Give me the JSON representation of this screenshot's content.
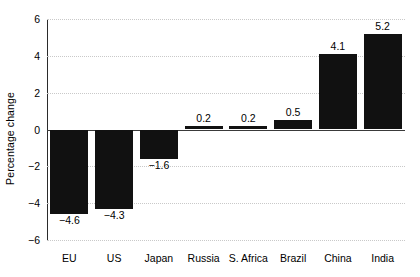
{
  "chart_data": {
    "type": "bar",
    "title": "",
    "xlabel": "",
    "ylabel": "Percentage change",
    "categories": [
      "EU",
      "US",
      "Japan",
      "Russia",
      "S. Africa",
      "Brazil",
      "China",
      "India"
    ],
    "values": [
      -4.6,
      -4.3,
      -1.6,
      0.2,
      0.2,
      0.5,
      4.1,
      5.2
    ],
    "value_labels": [
      "−4.6",
      "−4.3",
      "−1.6",
      "0.2",
      "0.2",
      "0.5",
      "4.1",
      "5.2"
    ],
    "ylim": [
      -6,
      6
    ],
    "yticks": [
      6,
      4,
      2,
      0,
      -2,
      -4,
      -6
    ],
    "ytick_labels": [
      "6",
      "4",
      "2",
      "0",
      "−2",
      "−4",
      "−6"
    ],
    "grid": true,
    "legend": "none",
    "bar_color": "#111111",
    "grid_color": "#c9c9c9",
    "axis_color": "#2b2b2b"
  }
}
